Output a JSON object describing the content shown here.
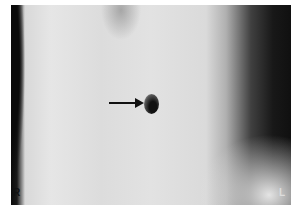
{
  "image": {
    "description": "Grayscale clinical photograph of an abdomen with an arrow pointing to the umbilicus",
    "markers": {
      "right": "R",
      "left": "L"
    },
    "annotation": {
      "type": "arrow",
      "points_to": "umbilicus"
    }
  }
}
